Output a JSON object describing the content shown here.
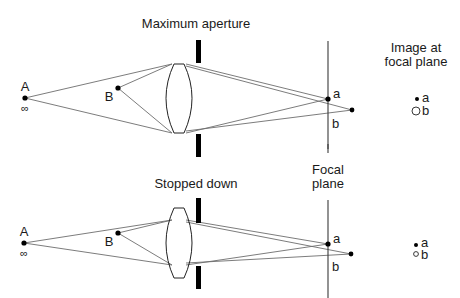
{
  "figure": {
    "top_panel": {
      "title": "Maximum aperture",
      "object_far": {
        "label": "A",
        "sublabel": "∞"
      },
      "object_near": {
        "label": "B"
      },
      "image_a": {
        "label": "a"
      },
      "image_b": {
        "label": "b"
      },
      "focal_plane_view": {
        "title_line1": "Image at",
        "title_line2": "focal plane",
        "point_a_label": "a",
        "point_b_label": "b"
      }
    },
    "bottom_panel": {
      "title": "Stopped down",
      "focal_plane_label_line1": "Focal",
      "focal_plane_label_line2": "plane",
      "object_far": {
        "label": "A",
        "sublabel": "∞"
      },
      "object_near": {
        "label": "B"
      },
      "image_a": {
        "label": "a"
      },
      "image_b": {
        "label": "b"
      },
      "focal_plane_view": {
        "point_a_label": "a",
        "point_b_label": "b"
      }
    },
    "colors": {
      "ray": "#6d6d6d",
      "ink": "#000000",
      "background": "#ffffff"
    }
  }
}
